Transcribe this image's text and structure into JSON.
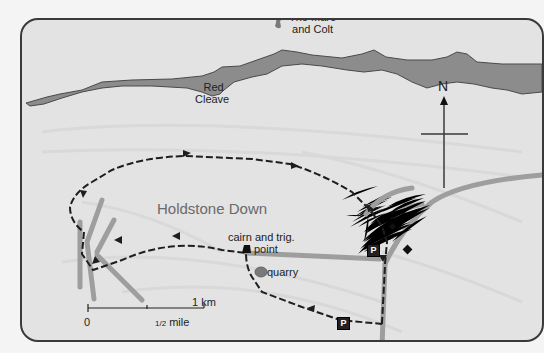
{
  "map": {
    "colors": {
      "background": "#e3e3e3",
      "ridge_fill": "#8c8c8c",
      "ridge_edge": "#4a4a4a",
      "road": "#9e9e9e",
      "route": "#1e1e1e",
      "frame": "#3a3a3a"
    },
    "labels": {
      "landmark_top": [
        "The Mare",
        "and Colt"
      ],
      "ridge": [
        "Red",
        "Cleave"
      ],
      "area": "Holdstone Down",
      "summit": [
        "cairn and trig.",
        "point"
      ],
      "quarry": "quarry"
    },
    "north_arrow": {
      "letter": "N"
    },
    "parking": [
      {
        "symbol": "P",
        "position": "east of route junction"
      },
      {
        "symbol": "P",
        "position": "south start point"
      }
    ],
    "scale_bar": {
      "start": "0",
      "mid": "1/2 mile",
      "mid_prefix": "1/2",
      "mid_unit": "mile",
      "end": "1 km"
    }
  }
}
